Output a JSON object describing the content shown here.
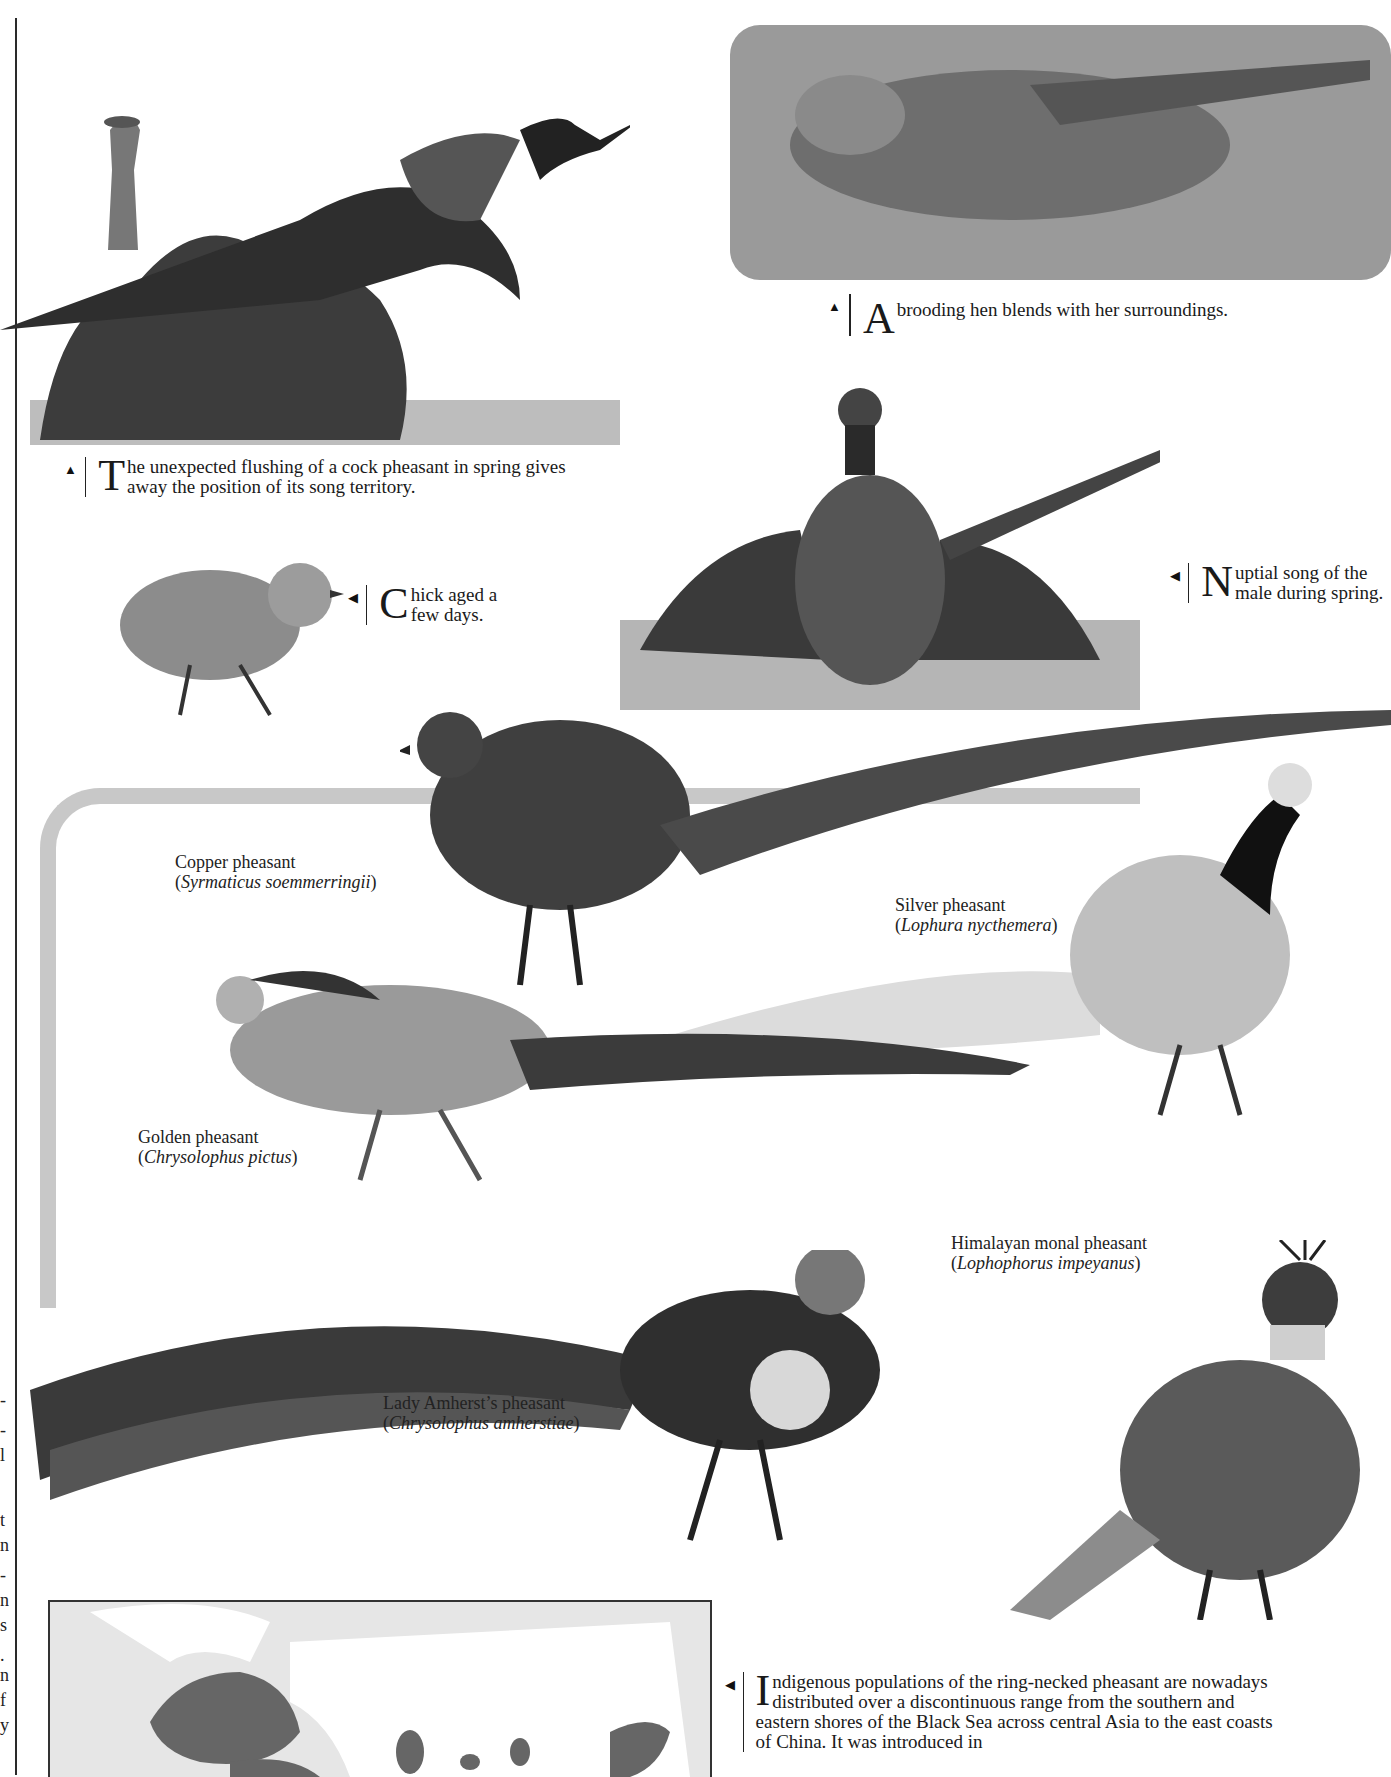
{
  "page": {
    "type": "book-page"
  },
  "captions": {
    "flushing": {
      "arrow": "▲",
      "dropcap": "T",
      "text": "he unexpected flushing of a cock pheasant in spring gives away the position of its song territory."
    },
    "hen": {
      "arrow": "▲",
      "dropcap": "A",
      "text": " brooding hen blends with her surroundings."
    },
    "chick": {
      "arrow": "◀",
      "dropcap": "C",
      "text": "hick aged a few days."
    },
    "nuptial": {
      "arrow": "◀",
      "dropcap": "N",
      "text": "uptial song of the male during spring."
    },
    "range": {
      "arrow": "◀",
      "dropcap": "I",
      "text": "ndigenous populations of the ring-necked pheasant are nowadays distributed over a discontinuous range from the southern and eastern shores of the Black Sea across central Asia to the east coasts of China. It was introduced in"
    }
  },
  "species": [
    {
      "common": "Copper pheasant",
      "scientific": "Syrmaticus soemmerringii"
    },
    {
      "common": "Silver pheasant",
      "scientific": "Lophura nycthemera"
    },
    {
      "common": "Golden pheasant",
      "scientific": "Chrysolophus pictus"
    },
    {
      "common": "Himalayan monal pheasant",
      "scientific": "Lophophorus impeyanus"
    },
    {
      "common": "Lady Amherst’s pheasant",
      "scientific": "Chrysolophus amherstiae"
    }
  ],
  "illustrations": [
    "cock pheasant flushing with observer",
    "brooding hen in foliage",
    "chick",
    "male nuptial display",
    "copper pheasant",
    "silver pheasant",
    "golden pheasant",
    "lady amherst's pheasant",
    "himalayan monal pheasant",
    "range map"
  ],
  "colors": {
    "frame": "#c8c8c8",
    "map_sea": "#e6e6e6",
    "map_range": "#666666",
    "map_land": "#ffffff"
  }
}
